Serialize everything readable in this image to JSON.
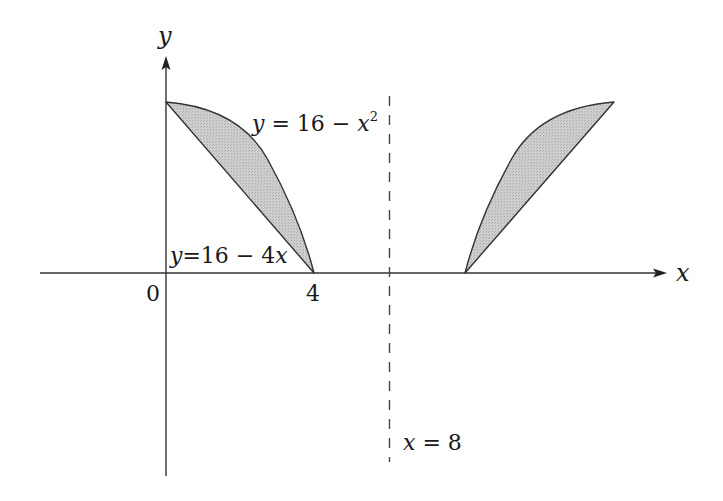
{
  "figure": {
    "type": "region-of-revolution-diagram",
    "axes": {
      "x_label": "x",
      "y_label": "y",
      "origin_label": "0",
      "tick_labels": [
        "4"
      ]
    },
    "curves": [
      {
        "name": "parabola",
        "label": "y = 16 − x",
        "superscript": "2",
        "equation": "y = 16 - x^2"
      },
      {
        "name": "line",
        "label": "y=16−4x",
        "equation": "y = 16 - 4x"
      }
    ],
    "axis_of_revolution": {
      "label": "x = 8",
      "style": "dashed"
    },
    "regions": [
      {
        "name": "shaded-region",
        "description": "Region between y = 16 - x^2 and y = 16 - 4x for 0 ≤ x ≤ 4"
      },
      {
        "name": "reflected-region",
        "description": "Mirror image of the shaded region across the dashed line"
      }
    ],
    "colors": {
      "stroke": "#333333",
      "fill": "#c8c8c8",
      "text": "#1a1a1a",
      "background": "#ffffff"
    }
  }
}
